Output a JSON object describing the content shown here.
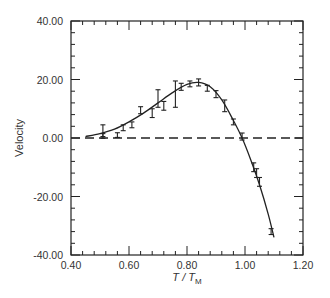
{
  "chart_data": {
    "type": "scatter",
    "title": "",
    "xlabel": "T / T_M",
    "xlabel_main": "T / T",
    "xlabel_sub": "M",
    "ylabel": "Velocity",
    "xlim": [
      0.4,
      1.2
    ],
    "ylim": [
      -40.0,
      40.0
    ],
    "x_ticks": [
      "0.40",
      "0.60",
      "0.80",
      "1.00",
      "1.20"
    ],
    "y_ticks": [
      "40.00",
      "20.00",
      "0.00",
      "-20.00",
      "-40.00"
    ],
    "grid": false,
    "legend": "none",
    "series": [
      {
        "name": "measured",
        "style": "points with error bars",
        "x": [
          0.51,
          0.51,
          0.56,
          0.58,
          0.61,
          0.64,
          0.68,
          0.7,
          0.72,
          0.76,
          0.78,
          0.81,
          0.84,
          0.87,
          0.9,
          0.93,
          0.96,
          0.99,
          1.03,
          1.04,
          1.05,
          1.09
        ],
        "y": [
          0.7,
          2.5,
          1.0,
          3.5,
          4.5,
          9.5,
          8.5,
          13.5,
          11.0,
          15.0,
          17.5,
          18.5,
          19.0,
          17.0,
          15.0,
          11.0,
          5.5,
          0.5,
          -10.0,
          -12.0,
          -15.0,
          -32.0
        ],
        "err": [
          0.8,
          2.0,
          0.8,
          1.0,
          1.0,
          1.2,
          1.5,
          3.0,
          1.5,
          4.5,
          1.2,
          1.0,
          1.2,
          1.0,
          1.2,
          2.0,
          1.0,
          1.2,
          1.5,
          1.5,
          1.5,
          1.0
        ]
      },
      {
        "name": "fit",
        "style": "solid line",
        "x": [
          0.45,
          0.5,
          0.55,
          0.6,
          0.65,
          0.7,
          0.75,
          0.8,
          0.84,
          0.88,
          0.92,
          0.96,
          0.99,
          1.02,
          1.05,
          1.08,
          1.1
        ],
        "y": [
          0.5,
          1.5,
          3.0,
          5.5,
          8.5,
          12.0,
          15.5,
          18.3,
          19.0,
          17.5,
          13.0,
          6.0,
          0.0,
          -7.5,
          -16.0,
          -26.0,
          -34.0
        ]
      },
      {
        "name": "zero-reference",
        "style": "dashed line",
        "x": [
          0.4,
          1.2
        ],
        "y": [
          0.0,
          0.0
        ]
      }
    ]
  }
}
